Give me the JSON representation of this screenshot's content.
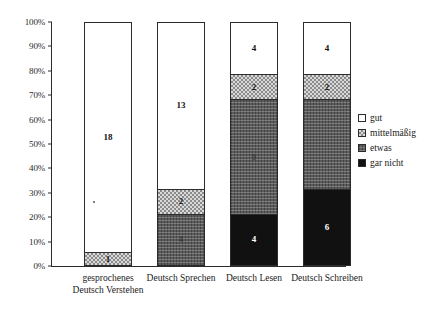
{
  "chart_data": {
    "type": "bar",
    "stacked": true,
    "normalized": true,
    "title": "",
    "xlabel": "",
    "ylabel": "",
    "ylim": [
      0,
      100
    ],
    "grid": false,
    "legend_position": "right",
    "y_ticks": [
      "0%",
      "10%",
      "20%",
      "30%",
      "40%",
      "50%",
      "60%",
      "70%",
      "80%",
      "90%",
      "100%"
    ],
    "categories": [
      "gesprochenes\nDeutsch Verstehen",
      "Deutsch Sprechen",
      "Deutsch Lesen",
      "Deutsch Schreiben"
    ],
    "series": [
      {
        "name": "gut",
        "key": "gut",
        "color": "#ffffff",
        "values": [
          18,
          13,
          4,
          4
        ]
      },
      {
        "name": "mittelmäßig",
        "key": "mittel",
        "color": "#d9d9d9",
        "values": [
          1,
          2,
          2,
          2
        ]
      },
      {
        "name": "etwas",
        "key": "etwas",
        "color": "#5c5c5c",
        "values": [
          0,
          4,
          9,
          7
        ]
      },
      {
        "name": "gar nicht",
        "key": "garnicht",
        "color": "#111111",
        "values": [
          0,
          0,
          4,
          6
        ]
      }
    ],
    "bars": [
      {
        "category": "gesprochenes\nDeutsch Verstehen",
        "line1": "gesprochenes",
        "line2": "Deutsch Verstehen",
        "total": 19,
        "segments": [
          {
            "series": "gut",
            "value": 18,
            "label": "18",
            "percent": 94.7
          },
          {
            "series": "mittelmäßig",
            "value": 1,
            "label": "1",
            "percent": 5.3
          }
        ]
      },
      {
        "category": "Deutsch Sprechen",
        "line1": "Deutsch Sprechen",
        "line2": "",
        "total": 19,
        "segments": [
          {
            "series": "gut",
            "value": 13,
            "label": "13",
            "percent": 68.4
          },
          {
            "series": "mittelmäßig",
            "value": 2,
            "label": "2",
            "percent": 10.5
          },
          {
            "series": "etwas",
            "value": 4,
            "label": "4",
            "percent": 21.1
          }
        ]
      },
      {
        "category": "Deutsch Lesen",
        "line1": "Deutsch Lesen",
        "line2": "",
        "total": 19,
        "segments": [
          {
            "series": "gut",
            "value": 4,
            "label": "4",
            "percent": 21.1
          },
          {
            "series": "mittelmäßig",
            "value": 2,
            "label": "2",
            "percent": 10.5
          },
          {
            "series": "etwas",
            "value": 9,
            "label": "9",
            "percent": 47.4
          },
          {
            "series": "gar nicht",
            "value": 4,
            "label": "4",
            "percent": 21.1
          }
        ]
      },
      {
        "category": "Deutsch Schreiben",
        "line1": "Deutsch Schreiben",
        "line2": "",
        "total": 19,
        "segments": [
          {
            "series": "gut",
            "value": 4,
            "label": "4",
            "percent": 21.1
          },
          {
            "series": "mittelmäßig",
            "value": 2,
            "label": "2",
            "percent": 10.5
          },
          {
            "series": "etwas",
            "value": 7,
            "label": "",
            "percent": 36.8
          },
          {
            "series": "gar nicht",
            "value": 6,
            "label": "6",
            "percent": 31.6
          }
        ]
      }
    ],
    "legend": [
      {
        "label": "gut",
        "swatch": "gut"
      },
      {
        "label": "mittelmäßig",
        "swatch": "mittel"
      },
      {
        "label": "etwas",
        "swatch": "etwas"
      },
      {
        "label": "gar nicht",
        "swatch": "garnicht"
      }
    ]
  }
}
